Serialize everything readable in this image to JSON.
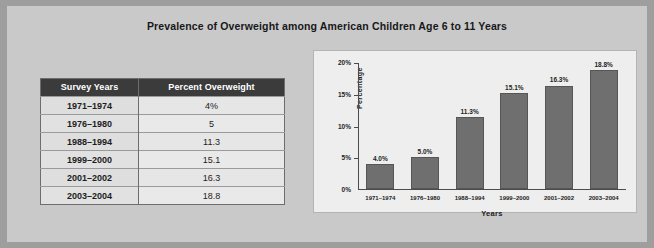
{
  "title": "Prevalence of Overweight among American Children Age 6 to 11 Years",
  "table": {
    "columns": [
      "Survey Years",
      "Percent Overweight"
    ],
    "rows": [
      {
        "years": "1971–1974",
        "percent": "4%"
      },
      {
        "years": "1976–1980",
        "percent": "5"
      },
      {
        "years": "1988–1994",
        "percent": "11.3"
      },
      {
        "years": "1999–2000",
        "percent": "15.1"
      },
      {
        "years": "2001–2002",
        "percent": "16.3"
      },
      {
        "years": "2003–2004",
        "percent": "18.8"
      }
    ]
  },
  "chart_data": {
    "type": "bar",
    "title": "",
    "xlabel": "Years",
    "ylabel": "Percentage",
    "categories": [
      "1971–1974",
      "1976–1980",
      "1988–1994",
      "1999–2000",
      "2001–2002",
      "2003–2004"
    ],
    "values": [
      4.0,
      5.0,
      11.3,
      15.1,
      16.3,
      18.8
    ],
    "data_labels": [
      "4.0%",
      "5.0%",
      "11.3%",
      "15.1%",
      "16.3%",
      "18.8%"
    ],
    "ylim": [
      0,
      20
    ],
    "yticks": [
      "0%",
      "5%",
      "10%",
      "15%",
      "20%"
    ],
    "ytick_values": [
      0,
      5,
      10,
      15,
      20
    ],
    "grid": false,
    "legend": "none",
    "bar_color": "#6f6f6f"
  },
  "colors": {
    "page_background": "#c9c9c9",
    "frame": "#9e9e9e",
    "panel_background": "#eeeeee",
    "table_header_background": "#3b3b3b",
    "table_header_text": "#ffffff",
    "bar": "#6f6f6f",
    "axis": "#4c4c4c",
    "text": "#1d1d1d"
  }
}
